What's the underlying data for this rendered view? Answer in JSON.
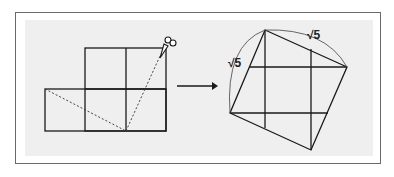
{
  "figure": {
    "left_shape": {
      "name": "five-square-cross-figure",
      "cells": [
        [
          1,
          0
        ],
        [
          2,
          0
        ],
        [
          0,
          1
        ],
        [
          1,
          1
        ],
        [
          2,
          1
        ]
      ],
      "cut_lines": "dashed"
    },
    "arrow": "right-arrow",
    "right_shape": {
      "name": "tilted-square",
      "side_labels": [
        "√5",
        "√5"
      ]
    },
    "tool_icon": "scissors-icon"
  },
  "labels": {
    "side_left": "√5",
    "side_top": "√5"
  },
  "colors": {
    "line": "#1a1a1a",
    "panel": "#efefef",
    "border": "#6a6a6a"
  }
}
